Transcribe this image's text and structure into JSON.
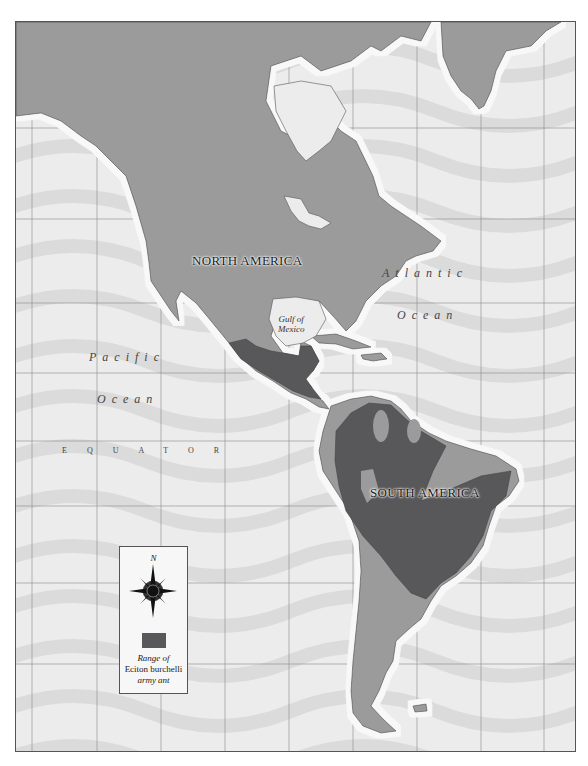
{
  "map": {
    "colors": {
      "ocean": "#ececec",
      "ocean_band": "#dadada",
      "land": "#9b9b9b",
      "coast_halo": "#f8f8f8",
      "range": "#58585a",
      "grid": "#8a8a8a"
    },
    "labels": {
      "north_america": "NORTH AMERICA",
      "south_america": "SOUTH AMERICA",
      "atlantic_1": "Atlantic",
      "atlantic_2": "Ocean",
      "pacific_1": "Pacific",
      "pacific_2": "Ocean",
      "equator": "EQUATOR",
      "gulf_1": "Gulf of",
      "gulf_2": "Mexico"
    }
  },
  "legend": {
    "north_label": "N",
    "compass_icon": "compass-rose",
    "range_line1": "Range of",
    "range_line2": "Eciton burchelli",
    "range_line3": "army ant"
  }
}
